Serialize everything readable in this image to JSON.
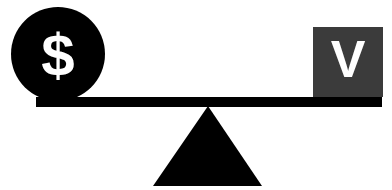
{
  "diagram": {
    "left_symbol": "$",
    "right_symbol": "V",
    "colors": {
      "circle": "#000000",
      "square": "#3b3b3b",
      "beam": "#000000",
      "fulcrum": "#000000",
      "symbol_text": "#ffffff"
    }
  }
}
